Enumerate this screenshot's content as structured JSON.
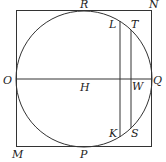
{
  "diagram": {
    "square": {
      "x1": 16,
      "y1": 10,
      "x2": 152,
      "y2": 147
    },
    "circle": {
      "cx": 84,
      "cy": 79,
      "r": 68
    },
    "diameter_oq": {
      "x1": 16,
      "y1": 79,
      "x2": 152,
      "y2": 79
    },
    "chord_lk": {
      "x": 120,
      "y1": 21,
      "y2": 137
    },
    "chord_ts": {
      "x": 131,
      "y1": 30,
      "y2": 128
    },
    "labels": {
      "R": {
        "text": "R",
        "x": 80,
        "y": 8
      },
      "N": {
        "text": "N",
        "x": 149,
        "y": 8
      },
      "L": {
        "text": "L",
        "x": 109,
        "y": 28
      },
      "T": {
        "text": "T",
        "x": 131,
        "y": 28
      },
      "O": {
        "text": "O",
        "x": 3,
        "y": 84
      },
      "H": {
        "text": "H",
        "x": 80,
        "y": 91
      },
      "W": {
        "text": "W",
        "x": 132,
        "y": 90
      },
      "Q": {
        "text": "Q",
        "x": 153,
        "y": 84
      },
      "K": {
        "text": "K",
        "x": 109,
        "y": 137
      },
      "S": {
        "text": "S",
        "x": 131,
        "y": 137
      },
      "M": {
        "text": "M",
        "x": 12,
        "y": 158
      },
      "P": {
        "text": "P",
        "x": 80,
        "y": 158
      }
    }
  }
}
